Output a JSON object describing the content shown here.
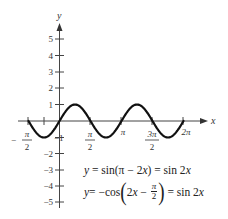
{
  "chart_data": {
    "type": "line",
    "title": "",
    "xlabel": "x",
    "ylabel": "y",
    "xlim": [
      -1.5708,
      6.2832
    ],
    "ylim": [
      -5,
      5
    ],
    "grid": false,
    "x_ticks": [
      {
        "value": -1.5708,
        "label_num": "π",
        "label_den": "2",
        "sign": "−"
      },
      {
        "value": -0.7854,
        "label_num": "",
        "label_den": "",
        "sign": ""
      },
      {
        "value": 1.5708,
        "label_num": "π",
        "label_den": "2",
        "sign": ""
      },
      {
        "value": 3.1416,
        "label": "π"
      },
      {
        "value": 4.7124,
        "label_num": "3π",
        "label_den": "2",
        "sign": ""
      },
      {
        "value": 6.2832,
        "label": "2π"
      }
    ],
    "y_ticks": [
      "5",
      "4",
      "3",
      "2",
      "1",
      "−1",
      "−2",
      "−3",
      "−4",
      "−5"
    ],
    "y_tick_values": [
      5,
      4,
      3,
      2,
      1,
      -1,
      -2,
      -3,
      -4,
      -5
    ],
    "series": [
      {
        "name": "y = sin 2x",
        "function": "sin(2x)",
        "x_range": [
          -1.5708,
          6.2832
        ],
        "x": [
          -1.5708,
          -0.7854,
          0,
          0.7854,
          1.5708,
          2.3562,
          3.1416,
          3.927,
          4.7124,
          5.4978,
          6.2832
        ],
        "values": [
          0,
          -1,
          0,
          1,
          0,
          -1,
          0,
          1,
          0,
          -1,
          0
        ]
      }
    ],
    "annotations": [
      "y = sin(π − 2x) = sin 2x",
      "y = −cos(2x − π/2) = sin 2x"
    ]
  },
  "labels": {
    "x_axis": "x",
    "y_axis": "y",
    "pi": "π",
    "two": "2",
    "minus": "−",
    "three_pi": "3π",
    "two_pi": "2π"
  },
  "equations": {
    "eq1": {
      "y": "y",
      "rest1": " = sin(π − 2",
      "x1": "x",
      "rest2": ") = sin 2",
      "x2": "x"
    },
    "eq2": {
      "y": "y",
      "rest1": " = −cos",
      "open": "(",
      "two": "2",
      "x1": "x",
      "minus": " − ",
      "frac_num": "π",
      "frac_den": "2",
      "close": ")",
      "rest2": " = sin 2",
      "x2": "x"
    }
  }
}
